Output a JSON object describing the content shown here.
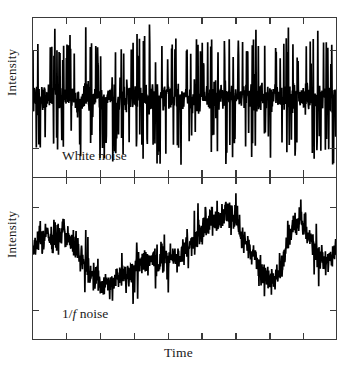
{
  "figure": {
    "background": "#ffffff",
    "ink": "#1a1a1a",
    "frame_color": "#3a3a3a",
    "trace_color": "#000000"
  },
  "axes": {
    "xlabel": "Time",
    "ylabel": "Intensity",
    "x_tick_count": 8,
    "y_tick_count": 2,
    "x_tick_labels": [],
    "y_tick_labels": [],
    "grid": false
  },
  "panels": [
    {
      "id": "white",
      "label": "White noise",
      "label_parts": [
        {
          "text": "White noise",
          "italic": false
        }
      ]
    },
    {
      "id": "pink",
      "label": "1/f noise",
      "label_parts": [
        {
          "text": "1/",
          "italic": false
        },
        {
          "text": "f",
          "italic": true
        },
        {
          "text": " noise",
          "italic": false
        }
      ]
    }
  ],
  "chart_data": [
    {
      "type": "line",
      "title": "White noise",
      "xlabel": "Time",
      "ylabel": "Intensity",
      "grid": false,
      "legend": "none",
      "xlim": [
        0,
        1000
      ],
      "ylim": [
        -1,
        1
      ],
      "annotations": [
        "White noise"
      ],
      "description": "Stationary broadband noise: flat power spectrum, constant variance, dense high-frequency spikes about a fixed mean.",
      "mean": 0.0,
      "std": 0.26,
      "n_points": 1000,
      "envelope_upper": [
        0.74,
        0.86,
        0.7,
        0.92,
        0.66,
        0.88,
        0.72,
        0.95,
        0.64,
        0.83,
        0.78,
        0.9,
        0.68,
        0.86,
        0.74,
        0.98,
        0.62,
        0.8,
        0.76,
        0.88,
        0.7,
        0.94,
        0.66,
        0.84,
        0.72,
        0.9,
        0.68,
        0.86,
        0.78,
        0.92,
        0.64,
        0.88,
        0.74,
        0.96,
        0.7,
        0.82,
        0.76,
        0.9,
        0.66,
        0.84
      ],
      "envelope_lower": [
        -0.8,
        -0.66,
        -0.9,
        -0.72,
        -0.86,
        -0.64,
        -0.94,
        -0.7,
        -0.82,
        -0.76,
        -0.88,
        -0.68,
        -0.92,
        -0.74,
        -0.84,
        -0.62,
        -0.9,
        -0.78,
        -0.7,
        -0.86,
        -0.96,
        -0.66,
        -0.88,
        -0.72,
        -0.8,
        -0.94,
        -0.68,
        -0.84,
        -0.76,
        -0.9,
        -0.7,
        -0.82,
        -0.92,
        -0.64,
        -0.86,
        -0.74,
        -0.88,
        -0.68,
        -0.8,
        -0.9
      ],
      "baseline": [
        0,
        0,
        0,
        0,
        0,
        0,
        0,
        0,
        0,
        0,
        0,
        0,
        0,
        0,
        0,
        0,
        0,
        0,
        0,
        0,
        0,
        0,
        0,
        0,
        0,
        0,
        0,
        0,
        0,
        0,
        0,
        0,
        0,
        0,
        0,
        0,
        0,
        0,
        0,
        0
      ]
    },
    {
      "type": "line",
      "title": "1/f noise",
      "xlabel": "Time",
      "ylabel": "Intensity",
      "grid": false,
      "legend": "none",
      "xlim": [
        0,
        1000
      ],
      "ylim": [
        -1,
        1
      ],
      "annotations": [
        "1/f noise"
      ],
      "description": "Pink (flicker) noise: power spectral density falls as 1/f, producing a slowly wandering baseline with fine-scale jitter superimposed.",
      "mean": 0.0,
      "std": 0.3,
      "n_points": 1000,
      "baseline": [
        0.1,
        0.24,
        0.3,
        0.22,
        0.34,
        0.18,
        0.06,
        -0.18,
        -0.3,
        -0.36,
        -0.3,
        -0.22,
        -0.26,
        -0.14,
        -0.04,
        0.02,
        -0.06,
        0.0,
        0.08,
        0.04,
        0.12,
        0.18,
        0.3,
        0.44,
        0.38,
        0.5,
        0.42,
        0.26,
        0.1,
        -0.04,
        -0.16,
        -0.26,
        -0.1,
        0.28,
        0.46,
        0.4,
        0.22,
        0.02,
        -0.12,
        0.14
      ],
      "jitter_amplitude": 0.2
    }
  ]
}
